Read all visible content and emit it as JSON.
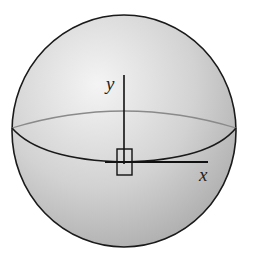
{
  "figure": {
    "type": "sphere-with-axes",
    "axes": {
      "y_label": "y",
      "x_label": "x"
    },
    "colors": {
      "sphere_fill_light": "#f2f2f2",
      "sphere_fill_dark": "#b8b8b8",
      "outline": "#1a1a1a",
      "back_equator": "#8a8a8a"
    }
  }
}
